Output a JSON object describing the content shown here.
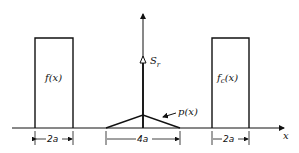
{
  "diagram": {
    "x_axis_label": "x",
    "vertical_marker_label": "S_r",
    "vertical_marker_label_main": "S",
    "vertical_marker_label_sub": "r",
    "left_box_label": "f(x)",
    "right_box_label_main": "f",
    "right_box_label_sub": "c",
    "right_box_label_tail": "(x)",
    "triangle_label": "p(x)",
    "left_width_label": "2a",
    "center_width_label": "4a",
    "right_width_label": "2a"
  }
}
